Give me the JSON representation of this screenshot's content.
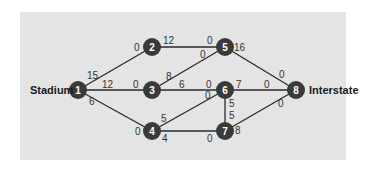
{
  "diagram": {
    "source_label": "Stadium",
    "sink_label": "Interstate",
    "nodes": [
      {
        "id": "1",
        "x": 78,
        "y": 90
      },
      {
        "id": "2",
        "x": 152,
        "y": 47
      },
      {
        "id": "3",
        "x": 152,
        "y": 90
      },
      {
        "id": "4",
        "x": 152,
        "y": 131
      },
      {
        "id": "5",
        "x": 225,
        "y": 47
      },
      {
        "id": "6",
        "x": 225,
        "y": 90
      },
      {
        "id": "7",
        "x": 225,
        "y": 131
      },
      {
        "id": "8",
        "x": 296,
        "y": 90
      }
    ],
    "edges": [
      {
        "from": "1",
        "to": "2",
        "cap_from": "15",
        "cap_to": "0"
      },
      {
        "from": "1",
        "to": "3",
        "cap_from": "12",
        "cap_to": "0"
      },
      {
        "from": "1",
        "to": "4",
        "cap_from": "6",
        "cap_to": "0"
      },
      {
        "from": "2",
        "to": "5",
        "cap_from": "12",
        "cap_to": "0"
      },
      {
        "from": "3",
        "to": "5",
        "cap_from": "8",
        "cap_to": "0"
      },
      {
        "from": "3",
        "to": "6",
        "cap_from": "6",
        "cap_to": "0"
      },
      {
        "from": "4",
        "to": "6",
        "cap_from": "5",
        "cap_to": "0"
      },
      {
        "from": "4",
        "to": "7",
        "cap_from": "4",
        "cap_to": "0"
      },
      {
        "from": "5",
        "to": "8",
        "cap_from": "16",
        "cap_to": "0"
      },
      {
        "from": "6",
        "to": "7",
        "cap_from": "5",
        "cap_to": "5"
      },
      {
        "from": "6",
        "to": "8",
        "cap_from": "7",
        "cap_to": "0"
      },
      {
        "from": "7",
        "to": "8",
        "cap_from": "8",
        "cap_to": "0"
      }
    ],
    "labels": {
      "e12_a": "15",
      "e12_b": "0",
      "e13_a": "12",
      "e13_b": "0",
      "e14_a": "6",
      "e14_b": "0",
      "e25_a": "12",
      "e25_b": "0",
      "e35_a": "8",
      "e35_b": "0",
      "e36_a": "6",
      "e36_b": "0",
      "e46_a": "5",
      "e46_b": "0",
      "e47_a": "4",
      "e47_b": "0",
      "e58_a": "16",
      "e58_b": "0",
      "e67_a": "5",
      "e67_b": "5",
      "e68_a": "7",
      "e68_b": "0",
      "e78_a": "8",
      "e78_b": "0"
    },
    "colors": {
      "panel": "#e4e4e4",
      "node": "#3a3a3a",
      "edge": "#2a2a2a"
    }
  }
}
